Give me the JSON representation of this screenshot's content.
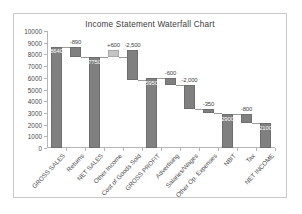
{
  "chart_data": {
    "type": "bar",
    "subtype": "waterfall",
    "title": "Income Statement Waterfall Chart",
    "xlabel": "",
    "ylabel": "",
    "ylim": [
      0,
      10000
    ],
    "ytick_step": 1000,
    "yticks": [
      0,
      1000,
      2000,
      3000,
      4000,
      5000,
      6000,
      7000,
      8000,
      9000,
      10000
    ],
    "ytick_labels": [
      "0",
      "1000",
      "2000",
      "3000",
      "4000",
      "5000",
      "6000",
      "7000",
      "8000",
      "9000",
      "10000"
    ],
    "grid": false,
    "legend": null,
    "categories": [
      "GROSS SALES",
      "Returns",
      "NET SALES",
      "Other Income",
      "Cost of Goods Sold",
      "GROSS PROFIT",
      "Advertising",
      "Salaries/Wages",
      "Other Op. Expenses",
      "NBIT",
      "Tax",
      "NET INCOME"
    ],
    "bars": [
      {
        "category": "GROSS SALES",
        "kind": "total",
        "value": 8640,
        "base": 0,
        "top": 8640,
        "label": "8640",
        "label_pos": "inside",
        "color": "#808080"
      },
      {
        "category": "Returns",
        "kind": "delta",
        "value": -890,
        "base": 7750,
        "top": 8640,
        "label": "-890",
        "label_pos": "outside",
        "color": "#808080"
      },
      {
        "category": "NET SALES",
        "kind": "total",
        "value": 7750,
        "base": 0,
        "top": 7750,
        "label": "7750",
        "label_pos": "inside",
        "color": "#808080"
      },
      {
        "category": "Other Income",
        "kind": "delta",
        "value": 600,
        "base": 7750,
        "top": 8350,
        "label": "+600",
        "label_pos": "outside",
        "color": "#c4c4c4"
      },
      {
        "category": "Cost of Goods Sold",
        "kind": "delta",
        "value": -2500,
        "base": 5850,
        "top": 8350,
        "label": "-2,500",
        "label_pos": "outside",
        "color": "#808080"
      },
      {
        "category": "GROSS PROFIT",
        "kind": "total",
        "value": 5950,
        "base": 0,
        "top": 5950,
        "label": "5950",
        "label_pos": "inside",
        "color": "#808080"
      },
      {
        "category": "Advertising",
        "kind": "delta",
        "value": -600,
        "base": 5350,
        "top": 5950,
        "label": "-600",
        "label_pos": "outside",
        "color": "#808080"
      },
      {
        "category": "Salaries/Wages",
        "kind": "delta",
        "value": -2000,
        "base": 3350,
        "top": 5350,
        "label": "-2,000",
        "label_pos": "outside",
        "color": "#808080"
      },
      {
        "category": "Other Op. Expenses",
        "kind": "delta",
        "value": -350,
        "base": 3000,
        "top": 3350,
        "label": "-350",
        "label_pos": "outside",
        "color": "#808080"
      },
      {
        "category": "NBIT",
        "kind": "total",
        "value": 2900,
        "base": 0,
        "top": 2900,
        "label": "2900",
        "label_pos": "inside",
        "color": "#808080"
      },
      {
        "category": "Tax",
        "kind": "delta",
        "value": -800,
        "base": 2100,
        "top": 2900,
        "label": "-800",
        "label_pos": "outside",
        "color": "#808080"
      },
      {
        "category": "NET INCOME",
        "kind": "total",
        "value": 2100,
        "base": 0,
        "top": 2100,
        "label": "2100",
        "label_pos": "inside",
        "color": "#808080"
      }
    ]
  },
  "colors": {
    "bar_dark": "#808080",
    "bar_light": "#c4c4c4",
    "axis": "#b5b5b5",
    "frame_border": "#c9c9c9",
    "text": "#4a4a4a",
    "background": "#ffffff"
  }
}
